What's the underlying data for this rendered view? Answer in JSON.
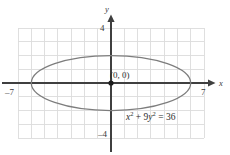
{
  "figure": {
    "title": "",
    "point_label": "(0, 0)",
    "equation_plain": "x² + 9y² = 36",
    "equation_parts": {
      "x": "x",
      "sup2_a": "2",
      "plus": " + ",
      "nine": "9",
      "y": "y",
      "sup2_b": "2",
      "equals": " = ",
      "rhs": "36"
    },
    "axis_names": {
      "x": "x",
      "y": "y"
    },
    "tick_labels": {
      "x_left": "–7",
      "x_right": "7",
      "y_top": "4",
      "y_bottom": "–4"
    },
    "colors": {
      "grid": "#dcdcdc",
      "axis": "#3f3f3f",
      "curve": "#7d7d7d",
      "text": "#2e2e2e",
      "background": "#ffffff"
    }
  },
  "chart_data": {
    "type": "line",
    "title": "",
    "subtitle": "",
    "xlabel": "x",
    "ylabel": "y",
    "equation": "x^2 + 9y^2 = 36",
    "curve_kind": "ellipse",
    "center": [
      0,
      0
    ],
    "semi_axis_x": 6,
    "semi_axis_y": 2,
    "vertices": [
      [
        -6,
        0
      ],
      [
        6,
        0
      ]
    ],
    "co_vertices": [
      [
        0,
        -2
      ],
      [
        0,
        2
      ]
    ],
    "xlim": [
      -7,
      7
    ],
    "ylim": [
      -4,
      4
    ],
    "xticks": [
      -7,
      7
    ],
    "yticks": [
      -4,
      4
    ],
    "grid": true,
    "grid_spacing": 1,
    "grid_x_range": [
      -7,
      7
    ],
    "grid_y_range": [
      -4,
      4
    ],
    "legend": null,
    "annotations": [
      {
        "text": "(0, 0)",
        "x": 0,
        "y": 0,
        "kind": "point-label"
      },
      {
        "text": "x^2 + 9y^2 = 36",
        "x": 3.6,
        "y": -2.6,
        "kind": "equation-label"
      }
    ],
    "points_marked": [
      [
        0,
        0
      ]
    ],
    "series": [
      {
        "name": "x^2 + 9y^2 = 36",
        "x": [
          6.0,
          5.88,
          5.51,
          4.93,
          4.16,
          3.24,
          2.22,
          1.13,
          0.0,
          -1.13,
          -2.22,
          -3.24,
          -4.16,
          -4.93,
          -5.51,
          -5.88,
          -6.0,
          -5.88,
          -5.51,
          -4.93,
          -4.16,
          -3.24,
          -2.22,
          -1.13,
          0.0,
          1.13,
          2.22,
          3.24,
          4.16,
          4.93,
          5.51,
          5.88,
          6.0
        ],
        "y": [
          0.0,
          0.39,
          0.77,
          1.11,
          1.41,
          1.68,
          1.86,
          1.97,
          2.0,
          1.97,
          1.86,
          1.68,
          1.41,
          1.11,
          0.77,
          0.39,
          0.0,
          -0.39,
          -0.77,
          -1.11,
          -1.41,
          -1.68,
          -1.86,
          -1.97,
          -2.0,
          -1.97,
          -1.86,
          -1.68,
          -1.41,
          -1.11,
          -0.77,
          -0.39,
          0.0
        ]
      }
    ]
  }
}
